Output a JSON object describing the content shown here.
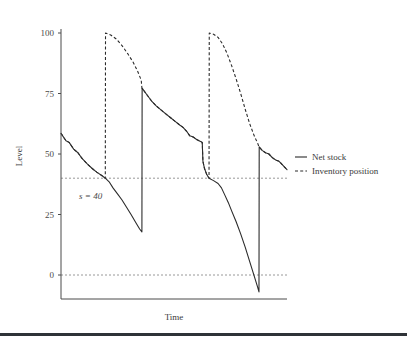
{
  "chart_data": {
    "type": "line",
    "title": "",
    "subtitle": "",
    "xlabel": "Time",
    "ylabel": "Level",
    "grid": false,
    "legend_position": "right",
    "xlim": [
      0,
      100
    ],
    "ylim": [
      -15,
      108
    ],
    "y_ticks": [
      0,
      25,
      50,
      75,
      100
    ],
    "y_tick_labels": [
      "0",
      "25",
      "50",
      "75",
      "100"
    ],
    "x_ticks": [],
    "x_tick_labels": [],
    "reference_lines": [
      {
        "name": "reorder-point",
        "value": 40,
        "label": "s = 40",
        "style": "dashed"
      },
      {
        "name": "zero-line",
        "value": 0,
        "label": "",
        "style": "dashed"
      }
    ],
    "annotations": [
      {
        "text": "s = 40",
        "x": 8,
        "y": 33
      }
    ],
    "series": [
      {
        "name": "Net stock",
        "style": "solid",
        "color": "#2b2b2b",
        "points": [
          [
            0.0,
            58.5
          ],
          [
            2.2,
            55.5
          ],
          [
            3.6,
            54.8
          ],
          [
            5.6,
            52.0
          ],
          [
            7.5,
            50.5
          ],
          [
            9.3,
            48.2
          ],
          [
            11.5,
            46.0
          ],
          [
            13.8,
            44.0
          ],
          [
            15.8,
            42.5
          ],
          [
            18.2,
            41.0
          ],
          [
            19.6,
            40.0
          ],
          [
            21.3,
            38.5
          ],
          [
            23.0,
            36.0
          ],
          [
            25.0,
            33.5
          ],
          [
            27.0,
            31.0
          ],
          [
            29.0,
            28.0
          ],
          [
            31.0,
            25.0
          ],
          [
            33.2,
            21.5
          ],
          [
            34.8,
            19.0
          ],
          [
            35.8,
            17.8
          ],
          [
            35.9,
            77.2
          ],
          [
            38.0,
            74.5
          ],
          [
            40.0,
            72.0
          ],
          [
            42.0,
            70.0
          ],
          [
            44.5,
            68.0
          ],
          [
            46.5,
            66.5
          ],
          [
            48.5,
            65.0
          ],
          [
            50.5,
            63.5
          ],
          [
            52.5,
            62.0
          ],
          [
            54.0,
            61.0
          ],
          [
            55.5,
            59.5
          ],
          [
            57.0,
            57.5
          ],
          [
            58.5,
            57.0
          ],
          [
            60.0,
            56.0
          ],
          [
            61.5,
            55.3
          ],
          [
            62.5,
            54.8
          ],
          [
            62.8,
            47.0
          ],
          [
            63.5,
            44.0
          ],
          [
            64.5,
            41.5
          ],
          [
            65.5,
            40.0
          ],
          [
            67.5,
            39.0
          ],
          [
            69.5,
            37.8
          ],
          [
            71.0,
            36.0
          ],
          [
            72.5,
            33.0
          ],
          [
            74.0,
            30.0
          ],
          [
            75.5,
            26.5
          ],
          [
            77.5,
            22.0
          ],
          [
            79.5,
            17.0
          ],
          [
            81.5,
            11.5
          ],
          [
            83.5,
            5.5
          ],
          [
            85.5,
            -0.5
          ],
          [
            87.0,
            -5.0
          ],
          [
            87.6,
            -7.0
          ],
          [
            87.7,
            53.0
          ],
          [
            89.0,
            51.5
          ],
          [
            90.5,
            50.5
          ],
          [
            92.0,
            50.0
          ],
          [
            93.5,
            48.5
          ],
          [
            95.0,
            47.5
          ],
          [
            96.5,
            47.0
          ],
          [
            98.0,
            45.5
          ],
          [
            100.0,
            43.5
          ]
        ]
      },
      {
        "name": "Inventory position",
        "style": "dashed",
        "color": "#2b2b2b",
        "points": [
          [
            0.0,
            58.5
          ],
          [
            2.2,
            55.5
          ],
          [
            3.6,
            54.8
          ],
          [
            5.6,
            52.0
          ],
          [
            7.5,
            50.5
          ],
          [
            9.3,
            48.2
          ],
          [
            11.5,
            46.0
          ],
          [
            13.8,
            44.0
          ],
          [
            15.8,
            42.5
          ],
          [
            18.2,
            41.0
          ],
          [
            19.6,
            40.0
          ],
          [
            19.7,
            100.0
          ],
          [
            22.0,
            99.2
          ],
          [
            24.5,
            97.5
          ],
          [
            27.0,
            94.8
          ],
          [
            29.5,
            91.5
          ],
          [
            32.0,
            87.8
          ],
          [
            34.0,
            84.0
          ],
          [
            35.5,
            80.5
          ],
          [
            35.8,
            77.2
          ],
          [
            38.0,
            74.5
          ],
          [
            40.0,
            72.0
          ],
          [
            42.0,
            70.0
          ],
          [
            44.5,
            68.0
          ],
          [
            46.5,
            66.5
          ],
          [
            48.5,
            65.0
          ],
          [
            50.5,
            63.5
          ],
          [
            52.5,
            62.0
          ],
          [
            54.0,
            61.0
          ],
          [
            55.5,
            59.5
          ],
          [
            57.0,
            57.5
          ],
          [
            58.5,
            57.0
          ],
          [
            60.0,
            56.0
          ],
          [
            61.5,
            55.3
          ],
          [
            62.5,
            54.8
          ],
          [
            62.8,
            47.0
          ],
          [
            63.5,
            44.0
          ],
          [
            64.5,
            41.5
          ],
          [
            65.5,
            40.0
          ],
          [
            65.6,
            100.0
          ],
          [
            67.5,
            99.5
          ],
          [
            69.5,
            98.2
          ],
          [
            71.5,
            95.5
          ],
          [
            73.5,
            91.5
          ],
          [
            75.5,
            86.5
          ],
          [
            77.5,
            81.0
          ],
          [
            79.5,
            75.0
          ],
          [
            81.5,
            68.5
          ],
          [
            83.5,
            62.5
          ],
          [
            85.5,
            57.5
          ],
          [
            87.0,
            54.5
          ],
          [
            87.6,
            53.0
          ],
          [
            89.0,
            51.5
          ],
          [
            90.5,
            50.5
          ],
          [
            92.0,
            50.0
          ],
          [
            93.5,
            48.5
          ],
          [
            95.0,
            47.5
          ],
          [
            96.5,
            47.0
          ],
          [
            98.0,
            45.5
          ],
          [
            100.0,
            43.5
          ]
        ]
      }
    ],
    "legend": [
      {
        "label": "Net stock",
        "style": "solid"
      },
      {
        "label": "Inventory position",
        "style": "dashed"
      }
    ]
  }
}
